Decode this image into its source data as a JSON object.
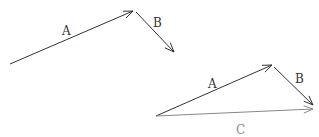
{
  "diagram": {
    "top": {
      "vectors": [
        {
          "label": "A",
          "from": [
            10,
            64
          ],
          "to": [
            133,
            11
          ],
          "color": "#333333"
        },
        {
          "label": "B",
          "from": [
            136,
            12
          ],
          "to": [
            174,
            52
          ],
          "color": "#333333"
        }
      ],
      "labels": [
        {
          "text": "A",
          "x": 62,
          "y": 35
        },
        {
          "text": "B",
          "x": 153,
          "y": 27
        }
      ]
    },
    "bottom": {
      "vectors": [
        {
          "label": "A",
          "from": [
            156,
            116
          ],
          "to": [
            272,
            65
          ],
          "color": "#333333"
        },
        {
          "label": "B",
          "from": [
            274,
            67
          ],
          "to": [
            313,
            105
          ],
          "color": "#333333"
        },
        {
          "label": "C",
          "from": [
            156,
            116
          ],
          "to": [
            313,
            109
          ],
          "color": "#888888"
        }
      ],
      "labels": [
        {
          "text": "A",
          "x": 208,
          "y": 88
        },
        {
          "text": "B",
          "x": 295,
          "y": 83
        },
        {
          "text": "C",
          "x": 236,
          "y": 134
        }
      ]
    }
  }
}
